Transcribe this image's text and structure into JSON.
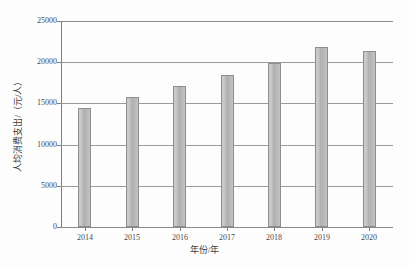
{
  "chart_data": {
    "type": "bar",
    "title": "",
    "xlabel": "年份/年",
    "ylabel": "人均消费支出/（元/人）",
    "categories": [
      "2014",
      "2015",
      "2016",
      "2017",
      "2018",
      "2019",
      "2020"
    ],
    "values": [
      14400,
      15750,
      17150,
      18500,
      19850,
      21800,
      21400
    ],
    "ylim": [
      0,
      25000
    ],
    "ytick_labels": [
      "0",
      "5000",
      "10000",
      "15000",
      "20000",
      "25000"
    ],
    "ytick_values": [
      0,
      5000,
      10000,
      15000,
      20000,
      25000
    ],
    "grid": "horizontal",
    "legend": "none",
    "bar_color": "#b5b5b5",
    "bar_edge_color": "#8e8e8e",
    "axis_color": "#8a8a8a",
    "grid_color": "#9a9a9a",
    "background_color": "#fdfdfd"
  }
}
